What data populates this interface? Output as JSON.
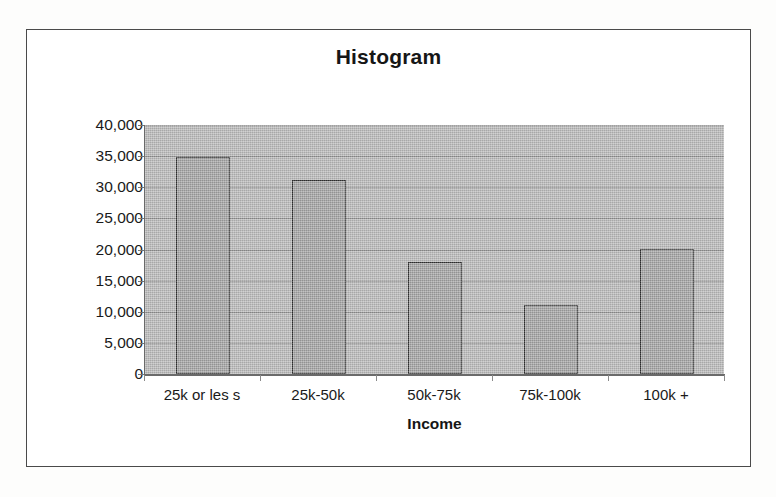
{
  "chart_data": {
    "type": "bar",
    "title": "Histogram",
    "xlabel": "Income",
    "ylabel": "Number of Households",
    "categories": [
      "25k or les s",
      "25k-50k",
      "50k-75k",
      "75k-100k",
      "100k +"
    ],
    "values": [
      34800,
      31200,
      18000,
      11100,
      20100
    ],
    "ylim": [
      0,
      40000
    ],
    "ytick_step": 5000,
    "ytick_labels": [
      "0",
      "5,000",
      "10,000",
      "15,000",
      "20,000",
      "25,000",
      "30,000",
      "35,000",
      "40,000"
    ],
    "ytick_values": [
      0,
      5000,
      10000,
      15000,
      20000,
      25000,
      30000,
      35000,
      40000
    ],
    "grid": true,
    "legend": false,
    "colors": {
      "bar_fill": "#a2a2a2",
      "bar_edge": "#2f2f2f",
      "plot_background": "#b9b9b9",
      "gridline": "#6e6e6e",
      "axis": "#6a6a6a",
      "text": "#1a1a1a",
      "frame_border": "#4a4a4a",
      "page_background": "#fdfdfc"
    }
  }
}
